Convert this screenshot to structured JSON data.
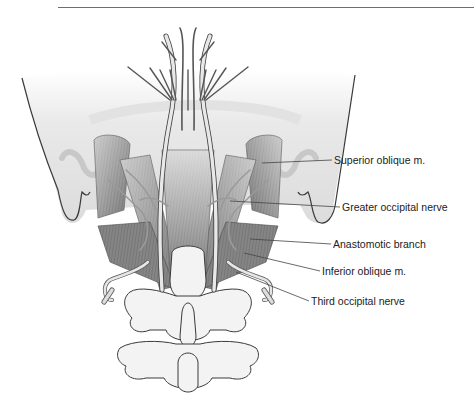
{
  "figure": {
    "type": "anatomical-illustration",
    "labels": [
      {
        "text": "Superior oblique m.",
        "x": 334,
        "y": 154,
        "line": [
          [
            262,
            163
          ],
          [
            332,
            160
          ]
        ]
      },
      {
        "text": "Greater occipital nerve",
        "x": 342,
        "y": 202,
        "line": [
          [
            230,
            201
          ],
          [
            340,
            207
          ]
        ]
      },
      {
        "text": "Anastomotic branch",
        "x": 333,
        "y": 239,
        "line": [
          [
            250,
            239
          ],
          [
            331,
            244
          ]
        ]
      },
      {
        "text": "Inferior oblique m.",
        "x": 322,
        "y": 265,
        "line": [
          [
            244,
            253
          ],
          [
            320,
            271
          ]
        ]
      },
      {
        "text": "Third occipital nerve",
        "x": 311,
        "y": 296,
        "line": [
          [
            236,
            272
          ],
          [
            309,
            301
          ]
        ]
      }
    ]
  },
  "colors": {
    "muscle_dark": "#6f6f6f",
    "muscle_light": "#b5b5b5",
    "bone": "#f2f2f2",
    "outline": "#3a3a3a",
    "skull": "#e6e6e6",
    "nerve": "#d9d9d9",
    "leader": "#444444"
  }
}
